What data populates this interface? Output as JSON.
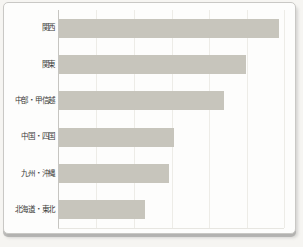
{
  "chart_data": {
    "type": "bar",
    "orientation": "horizontal",
    "title": "",
    "xlabel": "",
    "ylabel": "",
    "categories": [
      "関西",
      "関東",
      "中部・甲信越",
      "中国・四国",
      "九州・沖縄",
      "北海道・東北"
    ],
    "values": [
      97.8,
      83.1,
      73.3,
      51.1,
      48.9,
      38.2
    ],
    "values_note": "no numeric labels shown in figure; values estimated as percent of plot axis span",
    "xlim": [
      0,
      100
    ],
    "grid": true,
    "gridline_count": 6,
    "legend": "none",
    "colors": {
      "bar": "#c7c5bc",
      "axis": "#c6c5c1",
      "gridline": "#edece7",
      "plot_bottom": "#e7e6e1",
      "label_text": "#3b3b39",
      "card_background": "#fdfdfc",
      "card_border": "#c9c8c5",
      "page_background": "#f6f5f2"
    }
  }
}
